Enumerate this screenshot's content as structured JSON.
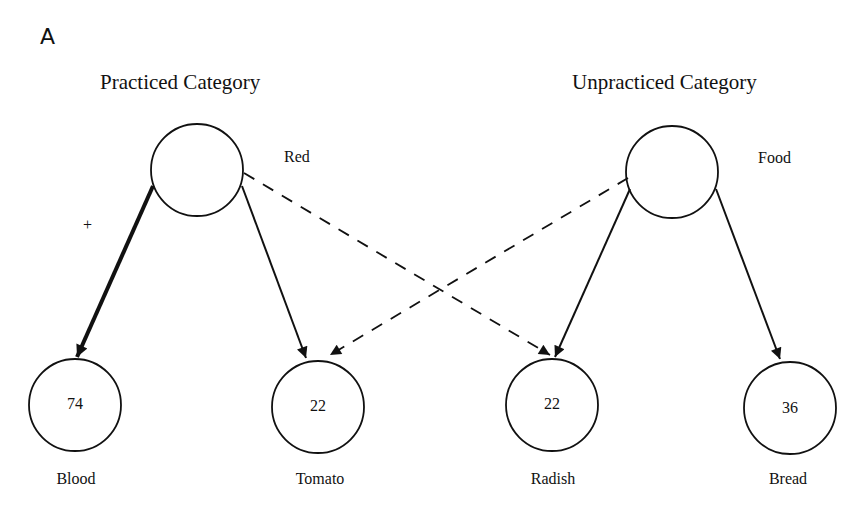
{
  "figure": {
    "panel_letter": "A",
    "categories": [
      {
        "title": "Practiced Category",
        "label": "Red"
      },
      {
        "title": "Unpracticed Category",
        "label": "Food"
      }
    ],
    "nodes": [
      {
        "label": "Blood",
        "value": "74"
      },
      {
        "label": "Tomato",
        "value": "22"
      },
      {
        "label": "Radish",
        "value": "22"
      },
      {
        "label": "Bread",
        "value": "36"
      }
    ],
    "practiced_marker": "+",
    "edges": [
      {
        "from": "Red",
        "to": "Blood",
        "style": "solid-thick",
        "marker": "+"
      },
      {
        "from": "Red",
        "to": "Tomato",
        "style": "solid"
      },
      {
        "from": "Red",
        "to": "Radish",
        "style": "dashed"
      },
      {
        "from": "Food",
        "to": "Tomato",
        "style": "dashed"
      },
      {
        "from": "Food",
        "to": "Radish",
        "style": "solid"
      },
      {
        "from": "Food",
        "to": "Bread",
        "style": "solid"
      }
    ],
    "colors": {
      "ink": "#111111",
      "background": "#ffffff"
    }
  }
}
